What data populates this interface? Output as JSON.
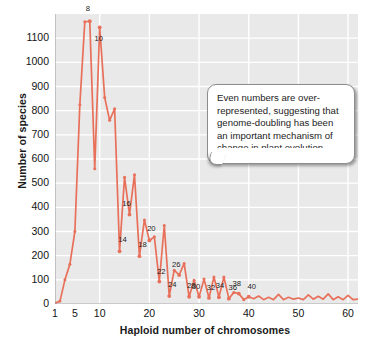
{
  "figure": {
    "top_caption_fragment": "",
    "background_color": "#ffffff",
    "plot_background_color": "#e9e9e9",
    "grid_color": "#ffffff",
    "line_color": "#e8705a",
    "marker_color": "#e8705a"
  },
  "callout": {
    "text": "Even numbers are over-represented, suggesting that genome-doubling has been an important mechanism of change in plant evolution.",
    "border_color": "#8d8d8d",
    "background_color": "#ffffff"
  },
  "chart_data": {
    "type": "line",
    "title": "",
    "xlabel": "Haploid number of chromosomes",
    "ylabel": "Number of species",
    "xlim": [
      1,
      62
    ],
    "ylim": [
      0,
      1200
    ],
    "grid": true,
    "legend": null,
    "xticks": [
      1,
      5,
      10,
      20,
      30,
      40,
      50,
      60
    ],
    "xtick_labels": [
      "1",
      "5",
      "10",
      "20",
      "30",
      "40",
      "50",
      "60"
    ],
    "yticks": [
      0,
      100,
      200,
      300,
      400,
      500,
      600,
      700,
      800,
      900,
      1000,
      1100
    ],
    "ytick_labels": [
      "0",
      "100",
      "200",
      "300",
      "400",
      "500",
      "600",
      "700",
      "800",
      "900",
      "1000",
      "1100"
    ],
    "x": [
      1,
      2,
      3,
      4,
      5,
      6,
      7,
      8,
      9,
      10,
      11,
      12,
      13,
      14,
      15,
      16,
      17,
      18,
      19,
      20,
      21,
      22,
      23,
      24,
      25,
      26,
      27,
      28,
      29,
      30,
      31,
      32,
      33,
      34,
      35,
      36,
      37,
      38,
      39,
      40,
      41,
      42,
      43,
      44,
      45,
      46,
      47,
      48,
      49,
      50,
      51,
      52,
      53,
      54,
      55,
      56,
      57,
      58,
      59,
      60,
      61,
      62
    ],
    "values": [
      3,
      12,
      100,
      165,
      300,
      825,
      1168,
      1170,
      560,
      1145,
      855,
      760,
      808,
      218,
      525,
      370,
      535,
      198,
      348,
      263,
      278,
      93,
      325,
      33,
      140,
      120,
      168,
      30,
      98,
      30,
      103,
      25,
      112,
      28,
      112,
      22,
      48,
      43,
      18,
      30,
      22,
      33,
      18,
      28,
      18,
      40,
      18,
      28,
      20,
      25,
      18,
      38,
      20,
      32,
      20,
      42,
      18,
      30,
      18,
      36,
      18,
      20
    ],
    "annotated_points": [
      {
        "x": 8,
        "label": "8"
      },
      {
        "x": 10,
        "label": "10"
      },
      {
        "x": 14,
        "label": "14"
      },
      {
        "x": 16,
        "label": "16"
      },
      {
        "x": 18,
        "label": "18"
      },
      {
        "x": 20,
        "label": "20"
      },
      {
        "x": 22,
        "label": "22"
      },
      {
        "x": 24,
        "label": "24"
      },
      {
        "x": 26,
        "label": "26"
      },
      {
        "x": 28,
        "label": "28"
      },
      {
        "x": 30,
        "label": "30"
      },
      {
        "x": 32,
        "label": "32"
      },
      {
        "x": 34,
        "label": "34"
      },
      {
        "x": 36,
        "label": "36"
      },
      {
        "x": 38,
        "label": "38"
      },
      {
        "x": 40,
        "label": "40"
      }
    ]
  }
}
